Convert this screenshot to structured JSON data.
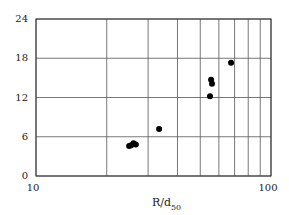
{
  "chart_data": {
    "type": "scatter",
    "title": "",
    "xlabel": "R/d50",
    "xlabel_main": "R/d",
    "xlabel_sub": "50",
    "ylabel": "",
    "xscale": "log",
    "xlim": [
      10,
      100
    ],
    "ylim": [
      0,
      24
    ],
    "x_ticks": [
      10,
      100
    ],
    "x_tick_labels": [
      "10",
      "100"
    ],
    "x_gridlines": [
      10,
      20,
      30,
      40,
      50,
      60,
      70,
      80,
      90,
      100
    ],
    "y_ticks": [
      0,
      6,
      12,
      18,
      24
    ],
    "y_tick_labels": [
      "0",
      "6",
      "12",
      "18",
      "24"
    ],
    "grid": true,
    "legend": null,
    "series": [
      {
        "name": "data",
        "points": [
          {
            "x": 24.9,
            "y": 4.6
          },
          {
            "x": 25.4,
            "y": 4.7
          },
          {
            "x": 26.0,
            "y": 5.0
          },
          {
            "x": 26.6,
            "y": 4.8
          },
          {
            "x": 33.4,
            "y": 7.2
          },
          {
            "x": 55.0,
            "y": 12.2
          },
          {
            "x": 55.6,
            "y": 14.7
          },
          {
            "x": 56.1,
            "y": 14.1
          },
          {
            "x": 67.6,
            "y": 17.3
          }
        ]
      }
    ]
  }
}
